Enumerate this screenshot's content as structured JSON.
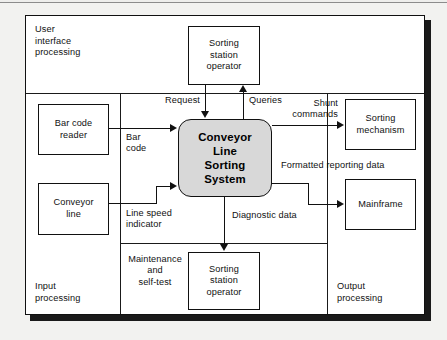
{
  "diagram": {
    "central_process": {
      "label": "Conveyor\nLine\nSorting\nSystem",
      "fill": "#d8d8d8"
    },
    "zones": [
      {
        "id": "user-interface-processing",
        "label": "User\ninterface\nprocessing"
      },
      {
        "id": "input-processing",
        "label": "Input\nprocessing"
      },
      {
        "id": "output-processing",
        "label": "Output\nprocessing"
      }
    ],
    "nodes": [
      {
        "id": "sorting-station-operator-top",
        "label": "Sorting\nstation\noperator"
      },
      {
        "id": "bar-code-reader",
        "label": "Bar code\nreader"
      },
      {
        "id": "conveyor-line",
        "label": "Conveyor\nline"
      },
      {
        "id": "sorting-station-operator-bottom",
        "label": "Sorting\nstation\noperator"
      },
      {
        "id": "sorting-mechanism",
        "label": "Sorting\nmechanism"
      },
      {
        "id": "mainframe",
        "label": "Mainframe"
      }
    ],
    "flows": [
      {
        "id": "request",
        "label": "Request"
      },
      {
        "id": "queries",
        "label": "Queries"
      },
      {
        "id": "bar-code",
        "label": "Bar\ncode"
      },
      {
        "id": "line-speed-indicator",
        "label": "Line speed\nindicator"
      },
      {
        "id": "shunt-commands",
        "label": "Shunt\ncommands"
      },
      {
        "id": "formatted-reporting-data",
        "label": "Formatted reporting data"
      },
      {
        "id": "diagnostic-data",
        "label": "Diagnostic data"
      },
      {
        "id": "maintenance-and-self-test",
        "label": "Maintenance\nand\nself-test"
      }
    ]
  }
}
